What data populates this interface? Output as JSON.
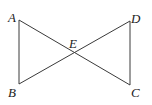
{
  "diagram": {
    "type": "geometry",
    "points": {
      "A": {
        "label": "A",
        "x": 19,
        "y": 20
      },
      "B": {
        "label": "B",
        "x": 19,
        "y": 84
      },
      "C": {
        "label": "C",
        "x": 130,
        "y": 85
      },
      "D": {
        "label": "D",
        "x": 130,
        "y": 21
      },
      "E": {
        "label": "E",
        "x": 74,
        "y": 52
      }
    },
    "segments": [
      {
        "from": "A",
        "to": "B"
      },
      {
        "from": "A",
        "to": "C"
      },
      {
        "from": "B",
        "to": "D"
      },
      {
        "from": "D",
        "to": "C"
      }
    ],
    "colors": {
      "line": "#3a3a3a",
      "label": "#222222",
      "background": "#ffffff"
    }
  }
}
